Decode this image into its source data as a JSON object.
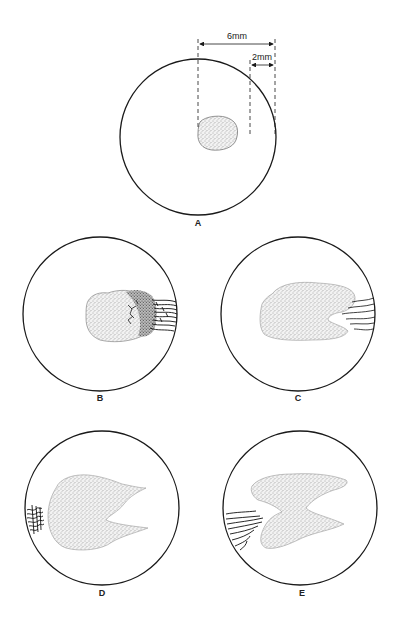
{
  "figure": {
    "colors": {
      "stroke": "#1a1a1a",
      "stipple": "#555555",
      "background": "#ffffff"
    },
    "panels": [
      {
        "id": "A",
        "label": "A",
        "description": "small circular stippled spot near center"
      },
      {
        "id": "B",
        "label": "B",
        "description": "enlarged lesion with dark cracked area and radiating dark lines at right edge"
      },
      {
        "id": "C",
        "label": "C",
        "description": "elongated stippled lesion with notch on right, radiating lines at right edge"
      },
      {
        "id": "D",
        "label": "D",
        "description": "lesion with deep V-shaped notch on right, radiating lines at left edge"
      },
      {
        "id": "E",
        "label": "E",
        "description": "hourglass / Z-shaped lesion, radiating lines at left edge"
      }
    ],
    "dimensions": [
      {
        "label": "6mm"
      },
      {
        "label": "2mm"
      }
    ]
  }
}
